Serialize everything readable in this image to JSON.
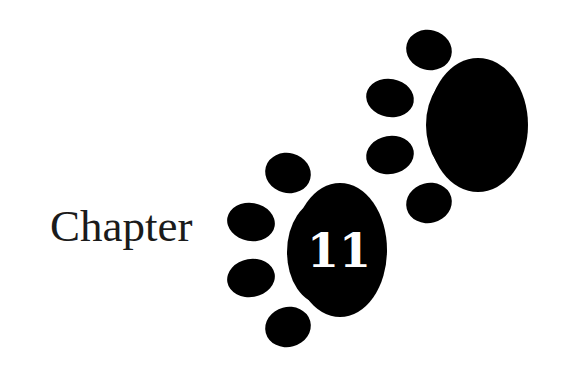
{
  "heading": {
    "label": "Chapter",
    "number": "11"
  },
  "decoration": {
    "icon": "paw-print-icon",
    "count": 2,
    "color": "#000000",
    "number_color": "#ffffff"
  }
}
